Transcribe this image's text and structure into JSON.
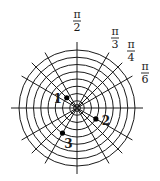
{
  "diagram": {
    "type": "polar-grid",
    "center": [
      77,
      108
    ],
    "ring_spacing": 7.25,
    "ring_count": 8,
    "inner_ring_radius": 3.5,
    "axis_extent": 66,
    "radial_angles_deg": [
      0,
      30,
      45,
      60,
      90,
      120,
      135,
      150,
      180,
      210,
      225,
      240,
      270,
      300,
      315,
      330
    ],
    "colors": {
      "line": "#1a1a1a",
      "background": "#ffffff",
      "point": "#000000"
    }
  },
  "angle_labels": [
    {
      "id": "pi-over-2",
      "numerator": "π",
      "denominator": "2",
      "x": 77,
      "y": 18
    },
    {
      "id": "pi-over-3",
      "numerator": "π",
      "denominator": "3",
      "x": 115,
      "y": 35
    },
    {
      "id": "pi-over-4",
      "numerator": "π",
      "denominator": "4",
      "x": 131,
      "y": 48
    },
    {
      "id": "pi-over-6",
      "numerator": "π",
      "denominator": "6",
      "x": 145,
      "y": 70
    }
  ],
  "points": [
    {
      "label": "1",
      "ring": 2,
      "angle_deg": 135,
      "label_dx": -9,
      "label_dy": 1
    },
    {
      "label": "2",
      "ring": 3,
      "angle_deg": 330,
      "label_dx": 10,
      "label_dy": 2
    },
    {
      "label": "3",
      "ring": 4,
      "angle_deg": 240,
      "label_dx": 6,
      "label_dy": 11
    }
  ]
}
